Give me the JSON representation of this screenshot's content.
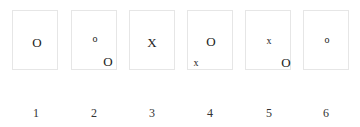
{
  "panels": [
    {
      "label": "1",
      "symbols": [
        {
          "text": "O",
          "size": "big",
          "position": "center"
        }
      ]
    },
    {
      "label": "2",
      "symbols": [
        {
          "text": "o",
          "size": "small",
          "position": "center"
        },
        {
          "text": "O",
          "size": "big",
          "position": "bottom-right"
        }
      ]
    },
    {
      "label": "3",
      "symbols": [
        {
          "text": "X",
          "size": "big",
          "position": "center"
        }
      ]
    },
    {
      "label": "4",
      "symbols": [
        {
          "text": "O",
          "size": "big",
          "position": "center"
        },
        {
          "text": "x",
          "size": "small",
          "position": "bottom-left"
        }
      ]
    },
    {
      "label": "5",
      "symbols": [
        {
          "text": "x",
          "size": "small",
          "position": "center"
        },
        {
          "text": "O",
          "size": "big",
          "position": "bottom-right"
        }
      ]
    },
    {
      "label": "6",
      "symbols": [
        {
          "text": "o",
          "size": "small",
          "position": "center"
        }
      ]
    }
  ]
}
